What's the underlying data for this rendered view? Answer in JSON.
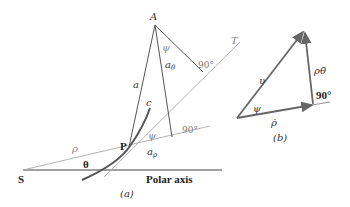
{
  "diagram_a": {
    "caption": "(a)",
    "points": {
      "S": "S",
      "P": "P",
      "A": "A",
      "T": "T"
    },
    "labels": {
      "a": "a",
      "a_theta": "a",
      "a_theta_sub": "θ",
      "a_rho": "a",
      "a_rho_sub": "ρ",
      "c": "c",
      "psi_top": "ψ",
      "psi_bottom": "ψ",
      "rho": "ρ",
      "theta": "θ",
      "right_angle_top": "90°",
      "right_angle_bottom": "90°",
      "polar_axis": "Polar axis"
    }
  },
  "diagram_b": {
    "caption": "(b)",
    "labels": {
      "v": "υ",
      "psi": "ψ",
      "rho_theta_dot": "ρθ̇",
      "rho_dot": "ρ̇",
      "right_angle": "90°"
    }
  },
  "colors": {
    "line_dark": "#555555",
    "line_light": "#aaaaaa",
    "arrow": "#666666"
  }
}
